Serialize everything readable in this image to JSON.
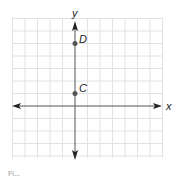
{
  "figure": {
    "axis_labels": {
      "x": "x",
      "y": "y"
    },
    "points": [
      {
        "name": "D",
        "label": "D",
        "x": 0,
        "y": 5
      },
      {
        "name": "C",
        "label": "C",
        "x": 0,
        "y": 1
      }
    ],
    "grid": {
      "x_range": [
        -5,
        7
      ],
      "y_range": [
        -4,
        7
      ],
      "spacing": 1
    },
    "colors": {
      "grid": "#e2e2e2",
      "axis": "#444444",
      "point": "#555555",
      "label": "#222222"
    },
    "caption": "Fi..."
  }
}
